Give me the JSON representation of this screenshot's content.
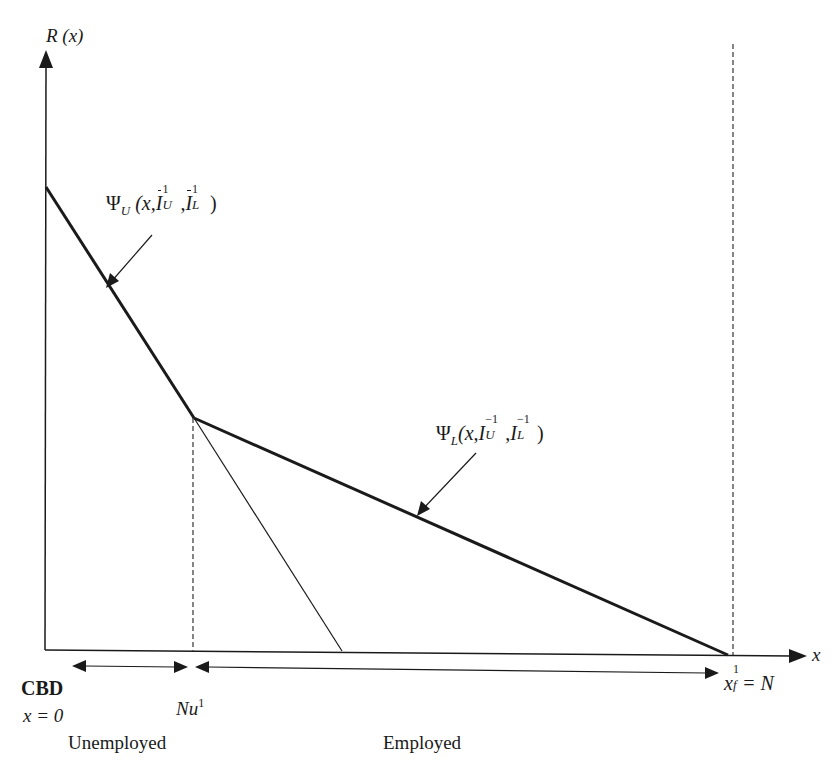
{
  "diagram": {
    "type": "bid-rent diagram",
    "y_axis": {
      "label_var": "R",
      "label_arg": "(x)"
    },
    "x_axis": {
      "label": "x"
    },
    "curves": {
      "psi_u": {
        "symbol": "Ψ",
        "subscript": "U",
        "args_prefix": "(x,",
        "arg1": "I",
        "arg1_sub": "U",
        "arg1_sup": "1",
        "arg2": "I",
        "arg2_sub": "L",
        "arg2_sup": "1",
        "close": ")",
        "bars": true
      },
      "psi_l": {
        "symbol": "Ψ",
        "subscript": "L",
        "args_prefix": "(x,",
        "arg1": "I",
        "arg1_sub": "U",
        "arg1_sup": "−1",
        "arg2": "I",
        "arg2_sub": "L",
        "arg2_sup": "−1",
        "close": ")",
        "bars": false
      }
    },
    "markers": {
      "cbd": "CBD",
      "cbd_eq": "x = 0",
      "nu_base": "Nu",
      "nu_sup": "1",
      "xf_base": "x",
      "xf_sup": "1",
      "xf_sub": "f",
      "xf_eq": "= N"
    },
    "zones": {
      "left": "Unemployed",
      "right": "Employed"
    },
    "colors": {
      "line": "#1a1a1a",
      "dashed": "#444444",
      "background": "#ffffff"
    }
  }
}
